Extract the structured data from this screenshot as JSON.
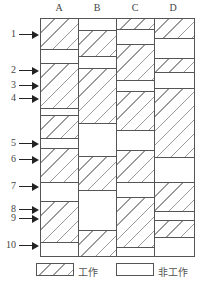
{
  "columns": [
    {
      "label": "A",
      "segments": [
        {
          "state": "work",
          "start": 0,
          "end": 31
        },
        {
          "state": "idle",
          "start": 31,
          "end": 45
        },
        {
          "state": "work",
          "start": 45,
          "end": 90
        },
        {
          "state": "idle",
          "start": 90,
          "end": 97
        },
        {
          "state": "work",
          "start": 97,
          "end": 120
        },
        {
          "state": "idle",
          "start": 120,
          "end": 130
        },
        {
          "state": "work",
          "start": 130,
          "end": 164
        },
        {
          "state": "idle",
          "start": 164,
          "end": 183
        },
        {
          "state": "work",
          "start": 183,
          "end": 224
        },
        {
          "state": "idle",
          "start": 224,
          "end": 239
        }
      ]
    },
    {
      "label": "B",
      "segments": [
        {
          "state": "idle",
          "start": 0,
          "end": 12
        },
        {
          "state": "work",
          "start": 12,
          "end": 38
        },
        {
          "state": "idle",
          "start": 38,
          "end": 50
        },
        {
          "state": "work",
          "start": 50,
          "end": 105
        },
        {
          "state": "idle",
          "start": 105,
          "end": 138
        },
        {
          "state": "work",
          "start": 138,
          "end": 172
        },
        {
          "state": "idle",
          "start": 172,
          "end": 212
        },
        {
          "state": "work",
          "start": 212,
          "end": 239
        }
      ]
    },
    {
      "label": "C",
      "segments": [
        {
          "state": "work",
          "start": 0,
          "end": 11
        },
        {
          "state": "idle",
          "start": 11,
          "end": 26
        },
        {
          "state": "work",
          "start": 26,
          "end": 62
        },
        {
          "state": "idle",
          "start": 62,
          "end": 73
        },
        {
          "state": "work",
          "start": 73,
          "end": 112
        },
        {
          "state": "idle",
          "start": 112,
          "end": 132
        },
        {
          "state": "work",
          "start": 132,
          "end": 164
        },
        {
          "state": "idle",
          "start": 164,
          "end": 179
        },
        {
          "state": "work",
          "start": 179,
          "end": 229
        },
        {
          "state": "idle",
          "start": 229,
          "end": 239
        }
      ]
    },
    {
      "label": "D",
      "segments": [
        {
          "state": "work",
          "start": 0,
          "end": 20
        },
        {
          "state": "idle",
          "start": 20,
          "end": 40
        },
        {
          "state": "work",
          "start": 40,
          "end": 54
        },
        {
          "state": "idle",
          "start": 54,
          "end": 70
        },
        {
          "state": "work",
          "start": 70,
          "end": 139
        },
        {
          "state": "idle",
          "start": 139,
          "end": 164
        },
        {
          "state": "work",
          "start": 164,
          "end": 193
        },
        {
          "state": "idle",
          "start": 193,
          "end": 202
        },
        {
          "state": "work",
          "start": 202,
          "end": 219
        },
        {
          "state": "idle",
          "start": 219,
          "end": 239
        }
      ]
    }
  ],
  "markers": [
    {
      "label": "1",
      "y": 34
    },
    {
      "label": "2",
      "y": 70
    },
    {
      "label": "3",
      "y": 85
    },
    {
      "label": "4",
      "y": 98
    },
    {
      "label": "5",
      "y": 143
    },
    {
      "label": "6",
      "y": 159
    },
    {
      "label": "7",
      "y": 186
    },
    {
      "label": "8",
      "y": 209
    },
    {
      "label": "9",
      "y": 218
    },
    {
      "label": "10",
      "y": 245
    }
  ],
  "legend": {
    "work_label": "工作",
    "idle_label": "非工作"
  }
}
